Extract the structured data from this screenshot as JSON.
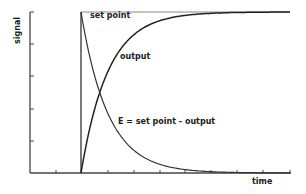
{
  "chart_data": {
    "type": "line",
    "title": "",
    "xlabel": "time",
    "ylabel": "signal",
    "ylim": [
      0,
      1
    ],
    "grid": false,
    "legend": "inline annotations",
    "step_time": 0,
    "time_constant": 1,
    "series": [
      {
        "name": "set point",
        "description": "step from 0 to 1 at t=0, constant afterwards",
        "x": [
          0,
          0,
          9
        ],
        "y": [
          0,
          1,
          1
        ]
      },
      {
        "name": "output",
        "description": "first-order rise 1 - exp(-t/tau)",
        "x": [
          0,
          0.5,
          0.7,
          1,
          2,
          3,
          4,
          5,
          6,
          7,
          8,
          9
        ],
        "y": [
          0,
          0.39,
          0.5,
          0.63,
          0.86,
          0.95,
          0.98,
          0.99,
          1.0,
          1.0,
          1.0,
          1.0
        ]
      },
      {
        "name": "E = set point - output",
        "description": "error decays exp(-t/tau)",
        "x": [
          0,
          0.5,
          0.7,
          1,
          2,
          3,
          4,
          5,
          6,
          7,
          8,
          9
        ],
        "y": [
          1,
          0.61,
          0.5,
          0.37,
          0.14,
          0.05,
          0.02,
          0.01,
          0.0,
          0.0,
          0.0,
          0.0
        ]
      }
    ],
    "annotations": [
      "set point",
      "output",
      "E = set point - output"
    ]
  },
  "labels": {
    "set_point": "set point",
    "output": "output",
    "error": "E = set point - output",
    "xaxis": "time",
    "yaxis": "signal"
  }
}
